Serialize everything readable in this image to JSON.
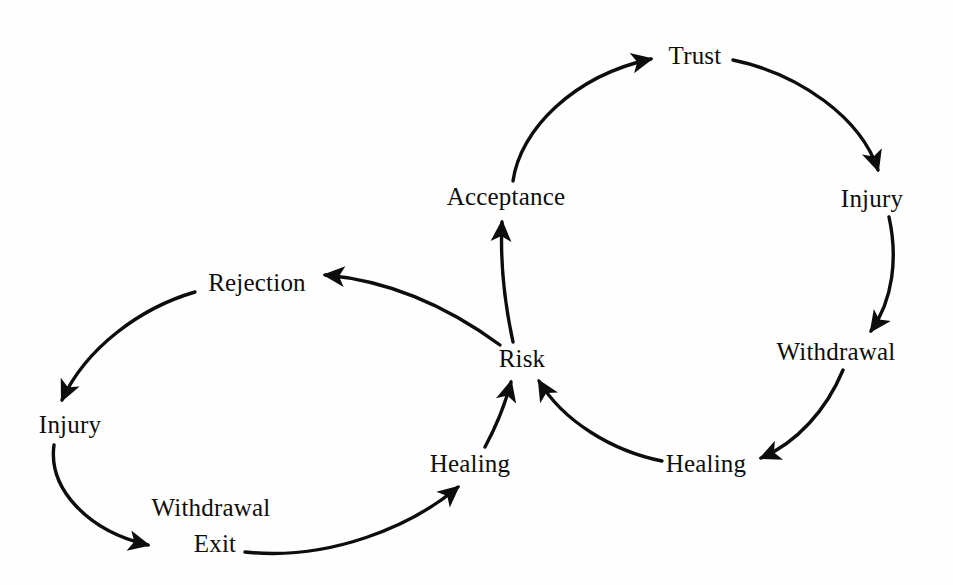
{
  "diagram": {
    "type": "cycle-diagram",
    "background_color": "#fefefe",
    "stroke_color": "#0d0d0d",
    "text_color": "#0d0d0d",
    "nodes": [
      {
        "id": "trust",
        "label": "Trust",
        "x": 695,
        "y": 56,
        "cycle": "right"
      },
      {
        "id": "injury-right",
        "label": "Injury",
        "x": 872,
        "y": 199,
        "cycle": "right"
      },
      {
        "id": "withdrawal-right",
        "label": "Withdrawal",
        "x": 836,
        "y": 352,
        "cycle": "right"
      },
      {
        "id": "healing-right",
        "label": "Healing",
        "x": 706,
        "y": 464,
        "cycle": "right"
      },
      {
        "id": "risk",
        "label": "Risk",
        "x": 522,
        "y": 359,
        "cycle": "shared"
      },
      {
        "id": "acceptance",
        "label": "Acceptance",
        "x": 506,
        "y": 197,
        "cycle": "right"
      },
      {
        "id": "rejection",
        "label": "Rejection",
        "x": 257,
        "y": 283,
        "cycle": "left"
      },
      {
        "id": "injury-left",
        "label": "Injury",
        "x": 70,
        "y": 425,
        "cycle": "left"
      },
      {
        "id": "withdrawal-exit",
        "label_line1": "Withdrawal",
        "label_line2": "Exit",
        "x": 211,
        "y": 526,
        "cycle": "left"
      },
      {
        "id": "healing-left",
        "label": "Healing",
        "x": 470,
        "y": 464,
        "cycle": "left"
      }
    ],
    "edges": [
      {
        "from": "acceptance",
        "to": "trust",
        "arrow": true
      },
      {
        "from": "trust",
        "to": "injury-right",
        "arrow": true
      },
      {
        "from": "injury-right",
        "to": "withdrawal-right",
        "arrow": true
      },
      {
        "from": "withdrawal-right",
        "to": "healing-right",
        "arrow": true
      },
      {
        "from": "healing-right",
        "to": "risk",
        "arrow": true
      },
      {
        "from": "risk",
        "to": "acceptance",
        "arrow": true
      },
      {
        "from": "risk",
        "to": "rejection",
        "arrow": true
      },
      {
        "from": "rejection",
        "to": "injury-left",
        "arrow": true
      },
      {
        "from": "injury-left",
        "to": "withdrawal-exit",
        "arrow": true
      },
      {
        "from": "withdrawal-exit",
        "to": "healing-left",
        "arrow": true
      },
      {
        "from": "healing-left",
        "to": "risk",
        "arrow": true
      }
    ]
  }
}
